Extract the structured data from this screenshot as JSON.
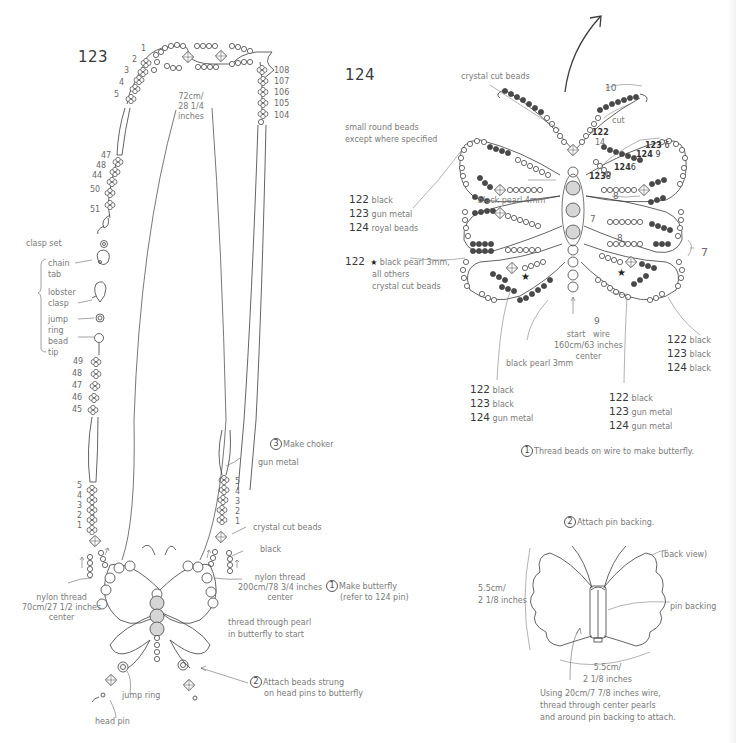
{
  "diagram_123": {
    "title": "123",
    "length_label": [
      "72cm/",
      "28 1/4",
      "inches"
    ],
    "left_row_numbers_top": [
      "1",
      "2",
      "3",
      "4",
      "5"
    ],
    "right_row_numbers_top": [
      "108",
      "107",
      "106",
      "105",
      "104"
    ],
    "left_row_numbers_mid": [
      "47",
      "48",
      "44",
      "50",
      "51"
    ],
    "clasp": {
      "heading": "clasp set",
      "parts": [
        {
          "label": "chain tab"
        },
        {
          "label": "lobster clasp"
        },
        {
          "label": "jump ring"
        },
        {
          "label": "bead tip"
        }
      ]
    },
    "left_row_numbers_low": [
      "49",
      "48",
      "47",
      "46",
      "45"
    ],
    "left_choker_numbers": [
      "5",
      "4",
      "3",
      "2",
      "1"
    ],
    "right_choker_numbers": [
      "5",
      "4",
      "3",
      "2",
      "1"
    ],
    "step3": {
      "num": "3",
      "label": "Make choker"
    },
    "labels": {
      "gun_metal": "gun metal",
      "crystal_cut": "crystal cut beads",
      "black": "black",
      "nylon_right": [
        "nylon thread",
        "200cm/78 3/4 inches",
        "center"
      ],
      "nylon_left": [
        "nylon thread",
        "70cm/27 1/2 inches",
        "center"
      ],
      "thread_through": [
        "thread through pearl",
        "in butterfly to start"
      ],
      "jump_ring": "jump ring",
      "head_pin": "head pin"
    },
    "step1": {
      "num": "1",
      "label": [
        "Make butterfly",
        "(refer to 124 pin)"
      ]
    },
    "step2": {
      "num": "2",
      "label": [
        "Attach beads strung",
        "on head pins to butterfly"
      ]
    }
  },
  "diagram_124": {
    "title": "124",
    "note": [
      "small round beads",
      "except where specified"
    ],
    "crystal_cut_label": "crystal cut beads",
    "color_key_1": [
      {
        "code": "122",
        "text": "black"
      },
      {
        "code": "123",
        "text": "gun metal"
      },
      {
        "code": "124",
        "text": "royal beads"
      }
    ],
    "star_note": {
      "code": "122",
      "star": "★",
      "lines": [
        "black pearl 3mm,",
        "all others",
        "crystal cut beads"
      ]
    },
    "black_pearl_4mm": "black pearl 4mm",
    "black_pearl_3mm": "black pearl 3mm",
    "start_label": [
      "start",
      "wire",
      "160cm/63 inches",
      "center"
    ],
    "counts": {
      "top": "10",
      "cut": "cut",
      "c122_14": [
        "122",
        "14"
      ],
      "c123_6": [
        "123",
        "6"
      ],
      "c124_9": [
        "124",
        "9"
      ],
      "c124_6": [
        "124",
        "6"
      ],
      "c123_8": [
        "123",
        "8"
      ],
      "eight_a": "8",
      "seven_a": "7",
      "eight_b": "8",
      "seven_r": "7",
      "nine": "9"
    },
    "color_key_left": [
      {
        "code": "122",
        "text": "black"
      },
      {
        "code": "123",
        "text": "black"
      },
      {
        "code": "124",
        "text": "gun metal"
      }
    ],
    "color_key_mid": [
      {
        "code": "122",
        "text": "black"
      },
      {
        "code": "123",
        "text": "gun metal"
      },
      {
        "code": "124",
        "text": "gun metal"
      }
    ],
    "color_key_right": [
      {
        "code": "122",
        "text": "black"
      },
      {
        "code": "123",
        "text": "black"
      },
      {
        "code": "124",
        "text": "black"
      }
    ],
    "step1": {
      "num": "1",
      "label": "Thread beads on wire to make butterfly."
    },
    "step2": {
      "num": "2",
      "label": "Attach pin backing."
    },
    "back_view": "(back view)",
    "pin_backing": "pin backing",
    "height_dim": [
      "5.5cm/",
      "2 1/8 inches"
    ],
    "width_dim": [
      "5.5cm/",
      "2 1/8 inches"
    ],
    "instructions": [
      "Using 20cm/7 7/8 inches wire,",
      "thread through center pearls",
      "and around pin backing to attach."
    ]
  },
  "colors": {
    "line": "#3c3c3c",
    "text": "#7a7a7a",
    "dark_bead": "#4a4a4a",
    "pearl": "#d6d6d6"
  }
}
